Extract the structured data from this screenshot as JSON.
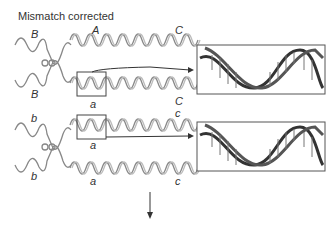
{
  "title": "Mismatch corrected",
  "top_pair": {
    "labels": {
      "upper_left": "B",
      "upper_mid": "A",
      "upper_right": "C",
      "lower_left": "B",
      "lower_mid": "a",
      "lower_right": "C"
    }
  },
  "bottom_pair": {
    "labels": {
      "upper_left": "b",
      "upper_mid": "a",
      "upper_right": "c",
      "lower_left": "b",
      "lower_mid": "a",
      "lower_right": "c"
    }
  },
  "colors": {
    "strand": "#8a8a8a",
    "dark": "#333333",
    "box": "#444444"
  }
}
